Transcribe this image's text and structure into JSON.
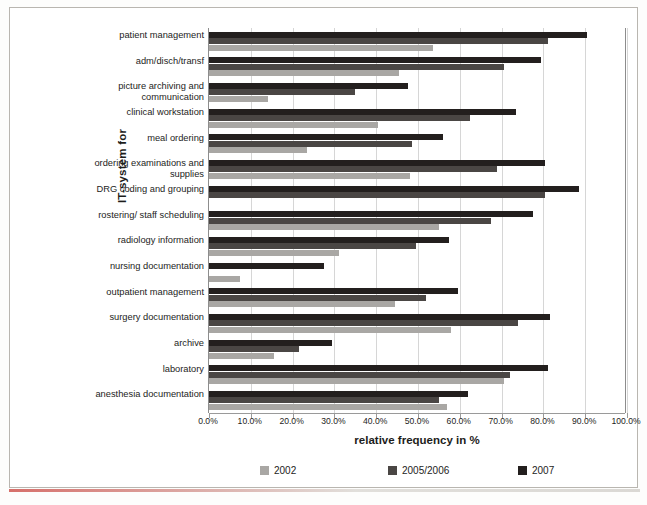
{
  "chart_data": {
    "type": "bar",
    "orientation": "horizontal",
    "title": "",
    "xlabel": "relative frequency in %",
    "ylabel": "IT-system for",
    "xlim": [
      0,
      100
    ],
    "xticks": [
      "0.0%",
      "10.0%",
      "20.0%",
      "30.0%",
      "40.0%",
      "50.0%",
      "60.0%",
      "70.0%",
      "80.0%",
      "90.0%",
      "100.0%"
    ],
    "grid": true,
    "legend_position": "bottom",
    "categories": [
      "patient management",
      "adm/disch/transf",
      "picture archiving and communication",
      "clinical workstation",
      "meal ordering",
      "ordering examinations and supplies",
      "DRG coding and grouping",
      "rostering/ staff scheduling",
      "radiology information",
      "nursing documentation",
      "outpatient management",
      "surgery documentation",
      "archive",
      "laboratory",
      "anesthesia documentation"
    ],
    "series": [
      {
        "name": "2007",
        "color": "#231f1e",
        "values": [
          90.5,
          79.5,
          47.5,
          73.5,
          56.0,
          80.5,
          88.5,
          77.5,
          57.5,
          27.5,
          59.5,
          81.5,
          29.5,
          81.0,
          62.0
        ]
      },
      {
        "name": "2005/2006",
        "color": "#4a4644",
        "values": [
          81.0,
          70.5,
          35.0,
          62.5,
          48.5,
          69.0,
          80.5,
          67.5,
          49.5,
          0.0,
          52.0,
          74.0,
          21.5,
          72.0,
          55.0
        ]
      },
      {
        "name": "2002",
        "color": "#a9a7a4",
        "values": [
          53.5,
          45.5,
          14.0,
          40.5,
          23.5,
          48.0,
          0.0,
          55.0,
          31.0,
          7.5,
          44.5,
          58.0,
          15.5,
          70.5,
          57.0
        ]
      }
    ]
  },
  "axes": {
    "y_title": "IT-system for",
    "x_title": "relative frequency in %"
  },
  "legend": {
    "items": [
      {
        "label": "2002",
        "color": "#a9a7a4"
      },
      {
        "label": "2005/2006",
        "color": "#4a4644"
      },
      {
        "label": "2007",
        "color": "#231f1e"
      }
    ]
  }
}
